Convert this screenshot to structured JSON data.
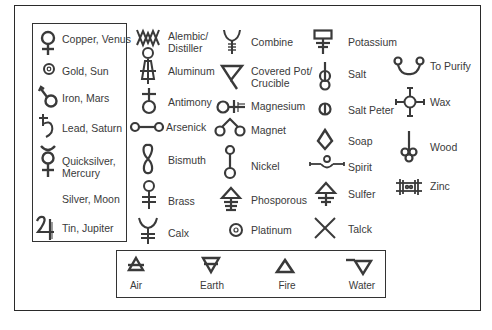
{
  "planets": [
    {
      "label": "Copper, Venus",
      "icon": "venus-icon"
    },
    {
      "label": "Gold, Sun",
      "icon": "sun-icon"
    },
    {
      "label": "Iron, Mars",
      "icon": "mars-icon"
    },
    {
      "label": "Lead, Saturn",
      "icon": "saturn-icon"
    },
    {
      "label": "Quicksilver,\nMercury",
      "icon": "mercury-icon"
    },
    {
      "label": "Silver, Moon",
      "icon": "moon-icon"
    },
    {
      "label": "Tin, Jupiter",
      "icon": "jupiter-icon"
    }
  ],
  "column2": [
    {
      "label": "Alembic/\nDistiller",
      "icon": "alembic-icon"
    },
    {
      "label": "Aluminum",
      "icon": "aluminum-icon"
    },
    {
      "label": "Antimony",
      "icon": "antimony-icon"
    },
    {
      "label": "Arsenick",
      "icon": "arsenic-icon"
    },
    {
      "label": "Bismuth",
      "icon": "bismuth-icon"
    },
    {
      "label": "Brass",
      "icon": "brass-icon"
    },
    {
      "label": "Calx",
      "icon": "calx-icon"
    }
  ],
  "column3": [
    {
      "label": "Combine",
      "icon": "combine-icon"
    },
    {
      "label": "Covered Pot/\nCrucible",
      "icon": "crucible-icon"
    },
    {
      "label": "Magnesium",
      "icon": "magnesium-icon"
    },
    {
      "label": "Magnet",
      "icon": "magnet-icon"
    },
    {
      "label": "Nickel",
      "icon": "nickel-icon"
    },
    {
      "label": "Phosporous",
      "icon": "phosphorus-icon"
    },
    {
      "label": "Platinum",
      "icon": "platinum-icon"
    }
  ],
  "column4": [
    {
      "label": "Potassium",
      "icon": "potassium-icon"
    },
    {
      "label": "Salt",
      "icon": "salt-icon"
    },
    {
      "label": "Salt Peter",
      "icon": "saltpeter-icon"
    },
    {
      "label": "Soap",
      "icon": "soap-icon"
    },
    {
      "label": "Spirit",
      "icon": "spirit-icon"
    },
    {
      "label": "Sulfer",
      "icon": "sulfur-icon"
    },
    {
      "label": "Talck",
      "icon": "talc-icon"
    }
  ],
  "column5": [
    {
      "label": "To Purify",
      "icon": "purify-icon"
    },
    {
      "label": "Wax",
      "icon": "wax-icon"
    },
    {
      "label": "Wood",
      "icon": "wood-icon"
    },
    {
      "label": "Zinc",
      "icon": "zinc-icon"
    }
  ],
  "elements": [
    {
      "label": "Air",
      "icon": "air-icon"
    },
    {
      "label": "Earth",
      "icon": "earth-icon"
    },
    {
      "label": "Fire",
      "icon": "fire-icon"
    },
    {
      "label": "Water",
      "icon": "water-icon"
    }
  ],
  "colors": {
    "stroke": "#3a3a3a",
    "text": "#3a3a3a",
    "border": "#2a2a2a",
    "background": "#ffffff"
  }
}
